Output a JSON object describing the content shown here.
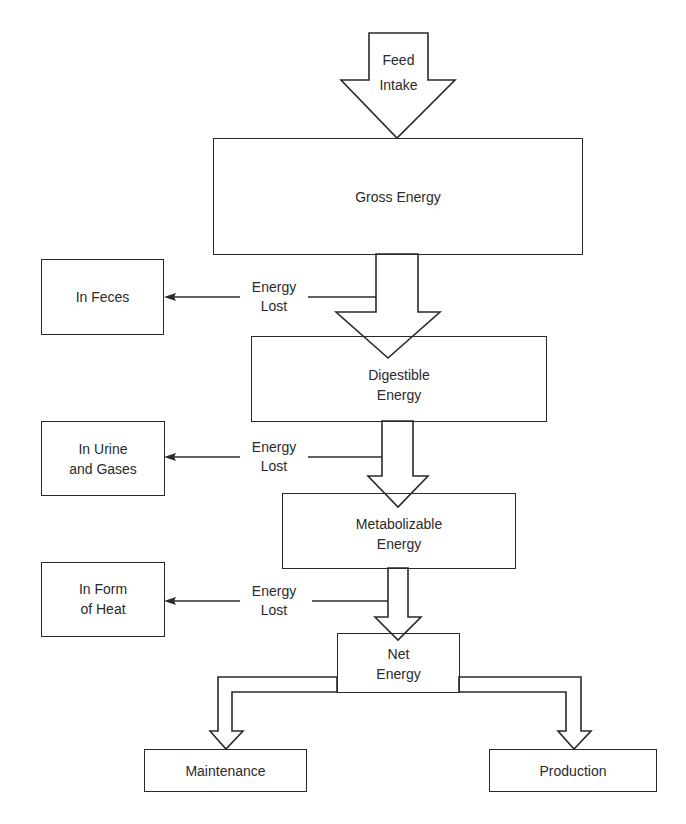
{
  "diagram": {
    "type": "energy-flow",
    "input": {
      "line1": "Feed",
      "line2": "Intake"
    },
    "stages": [
      {
        "id": "gross",
        "line1": "Gross Energy",
        "line2": ""
      },
      {
        "id": "digestible",
        "line1": "Digestible",
        "line2": "Energy"
      },
      {
        "id": "metabolizable",
        "line1": "Metabolizable",
        "line2": "Energy"
      },
      {
        "id": "net",
        "line1": "Net",
        "line2": "Energy"
      }
    ],
    "losses": [
      {
        "label1": "Energy",
        "label2": "Lost",
        "dest1": "In Feces",
        "dest2": ""
      },
      {
        "label1": "Energy",
        "label2": "Lost",
        "dest1": "In Urine",
        "dest2": "and Gases"
      },
      {
        "label1": "Energy",
        "label2": "Lost",
        "dest1": "In Form",
        "dest2": "of Heat"
      }
    ],
    "outputs": [
      {
        "id": "maintenance",
        "label": "Maintenance"
      },
      {
        "id": "production",
        "label": "Production"
      }
    ],
    "colors": {
      "line": "#2a2a2a",
      "background": "#ffffff"
    }
  }
}
